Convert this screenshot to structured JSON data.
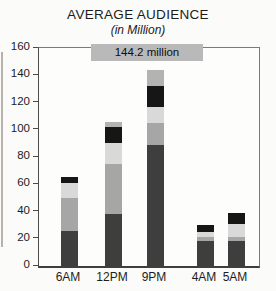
{
  "page": {
    "title": "AVERAGE AUDIENCE",
    "subtitle": "(in Million)"
  },
  "chart_data": {
    "type": "bar",
    "stacked": true,
    "title": "AVERAGE AUDIENCE",
    "subtitle": "(in Million)",
    "categories": [
      "6AM",
      "12PM",
      "9PM",
      "4AM",
      "5AM"
    ],
    "series": [
      {
        "name": "segment-bottom-dark-gray",
        "color": "#3e3e3e",
        "values": [
          26,
          38,
          89,
          18,
          18
        ]
      },
      {
        "name": "segment-medium-gray",
        "color": "#a6a6a6",
        "values": [
          24,
          37,
          16,
          3,
          3
        ]
      },
      {
        "name": "segment-light-gray",
        "color": "#d9d9d9",
        "values": [
          11,
          15,
          12,
          4,
          10
        ]
      },
      {
        "name": "segment-black",
        "color": "#161616",
        "values": [
          4,
          12,
          15,
          5,
          8
        ]
      },
      {
        "name": "segment-top-gray",
        "color": "#b3b3b3",
        "values": [
          0,
          4,
          12.2,
          0,
          0
        ]
      }
    ],
    "totals": [
      65,
      106,
      144.2,
      30,
      39
    ],
    "xlabel": "",
    "ylabel": "",
    "ylim": [
      0,
      160
    ],
    "yticks": [
      0,
      20,
      40,
      60,
      80,
      100,
      120,
      140,
      160
    ],
    "grid": false,
    "legend": "none",
    "annotation": {
      "text": "144.2 million",
      "target_category": "9PM",
      "bg_color": "#b9b9b9"
    }
  },
  "colors": {
    "background": "#fbfbf9",
    "axis": "#4c4c4c",
    "text": "#1a1a1a"
  }
}
